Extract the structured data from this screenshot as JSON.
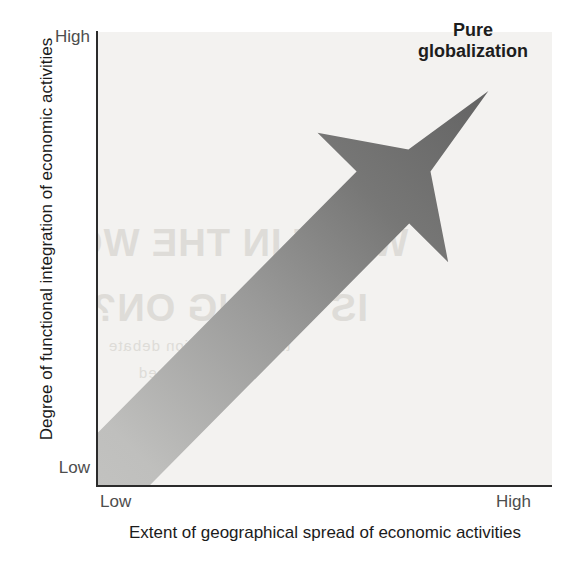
{
  "figure": {
    "background_color": "#ffffff",
    "plot_background_color": "#f3f2f0",
    "axis_color": "#2b2b2b"
  },
  "annotation": {
    "line1": "Pure",
    "line2": "globalization"
  },
  "y_axis": {
    "title": "Degree of functional integration of economic activities",
    "tick_high": "High",
    "tick_low": "Low"
  },
  "x_axis": {
    "title": "Extent of geographical spread of economic activities",
    "tick_low": "Low",
    "tick_high": "High"
  },
  "ghost_text": {
    "line1": "WHAT IN THE WO",
    "line2": "IS GOING ON?",
    "line3": "the globalization debate",
    "line4": "is confused"
  },
  "chart_data": {
    "type": "diagram",
    "title": "",
    "xlabel": "Extent of geographical spread of economic activities",
    "ylabel": "Degree of functional integration of economic activities",
    "xlim": [
      "Low",
      "High"
    ],
    "ylim": [
      "Low",
      "High"
    ],
    "grid": false,
    "legend": "none",
    "annotations": [
      {
        "label": "Pure globalization",
        "x": "High",
        "y": "High",
        "position": "top-right"
      }
    ],
    "series": [
      {
        "name": "Pure globalization arrow",
        "type": "arrow",
        "from": {
          "x": "Low",
          "y": "Low",
          "x_frac": 0.0,
          "y_frac": 0.0
        },
        "to": {
          "x": "High",
          "y": "High",
          "x_frac": 0.86,
          "y_frac": 0.87
        },
        "gradient_start_color": "#c6c6c4",
        "gradient_end_color": "#636363",
        "description": "Broad diagonal arrow rising from the low/low origin to the high/high corner, shaded light grey at the tail and dark grey at the head."
      }
    ]
  }
}
